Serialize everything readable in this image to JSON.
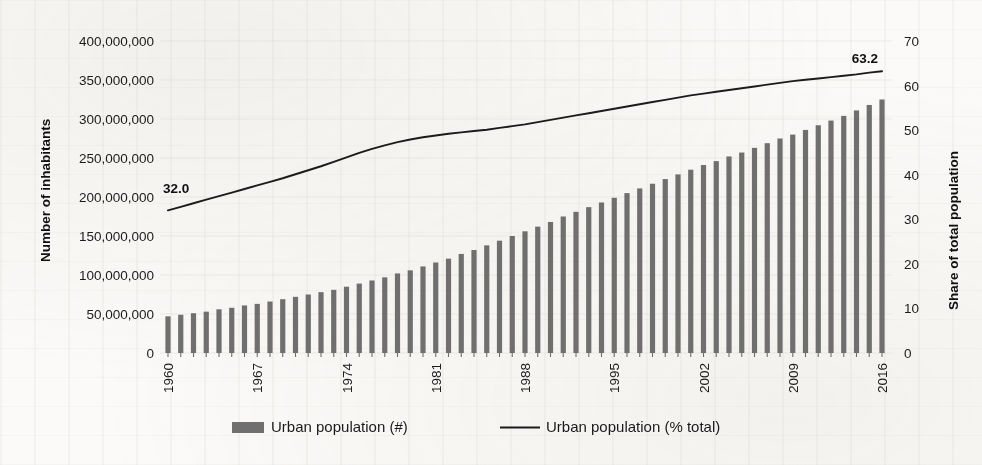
{
  "chart_data": {
    "type": "bar",
    "title": "",
    "subtitle": "",
    "xlabel": "",
    "ylabel": "Number of inhabitants",
    "y2label": "Share of total population",
    "grid": false,
    "legend_position": "bottom",
    "x": [
      1960,
      1961,
      1962,
      1963,
      1964,
      1965,
      1966,
      1967,
      1968,
      1969,
      1970,
      1971,
      1972,
      1973,
      1974,
      1975,
      1976,
      1977,
      1978,
      1979,
      1980,
      1981,
      1982,
      1983,
      1984,
      1985,
      1986,
      1987,
      1988,
      1989,
      1990,
      1991,
      1992,
      1993,
      1994,
      1995,
      1996,
      1997,
      1998,
      1999,
      2000,
      2001,
      2002,
      2003,
      2004,
      2005,
      2006,
      2007,
      2008,
      2009,
      2010,
      2011,
      2012,
      2013,
      2014,
      2015,
      2016
    ],
    "xtick_labels": [
      "1960",
      "1967",
      "1974",
      "1981",
      "1988",
      "1995",
      "2002",
      "2009",
      "2016"
    ],
    "ytick_labels": [
      "0",
      "50,000,000",
      "100,000,000",
      "150,000,000",
      "200,000,000",
      "250,000,000",
      "300,000,000",
      "350,000,000",
      "400,000,000"
    ],
    "y2tick_labels": [
      "0",
      "10",
      "20",
      "30",
      "40",
      "50",
      "60",
      "70"
    ],
    "ylim": [
      0,
      400000000
    ],
    "y2lim": [
      0,
      70
    ],
    "ytick_step": 50000000,
    "y2tick_step": 10,
    "series": [
      {
        "name": "Urban population (#)",
        "type": "bar",
        "axis": "left",
        "color": "#6f6f6f",
        "values": [
          47000000,
          49000000,
          51000000,
          53000000,
          56000000,
          58000000,
          61000000,
          63000000,
          66000000,
          69000000,
          72000000,
          75000000,
          78000000,
          81000000,
          85000000,
          89000000,
          93000000,
          97000000,
          102000000,
          106000000,
          111000000,
          116000000,
          121000000,
          127000000,
          132000000,
          138000000,
          144000000,
          150000000,
          156000000,
          162000000,
          168000000,
          175000000,
          181000000,
          187000000,
          193000000,
          199000000,
          205000000,
          211000000,
          217000000,
          223000000,
          229000000,
          235000000,
          241000000,
          246000000,
          252000000,
          257000000,
          263000000,
          269000000,
          275000000,
          280000000,
          286000000,
          292000000,
          298000000,
          304000000,
          311000000,
          318000000,
          325000000
        ]
      },
      {
        "name": "Urban population (% total)",
        "type": "line",
        "axis": "right",
        "color": "#1b1b1b",
        "values": [
          32.0,
          32.8,
          33.6,
          34.4,
          35.2,
          36.0,
          36.8,
          37.6,
          38.4,
          39.2,
          40.1,
          41.0,
          41.9,
          42.9,
          43.9,
          44.9,
          45.8,
          46.6,
          47.3,
          47.9,
          48.4,
          48.8,
          49.2,
          49.5,
          49.8,
          50.1,
          50.5,
          50.9,
          51.3,
          51.8,
          52.3,
          52.8,
          53.3,
          53.8,
          54.3,
          54.8,
          55.3,
          55.8,
          56.3,
          56.8,
          57.3,
          57.8,
          58.2,
          58.6,
          59.0,
          59.4,
          59.8,
          60.2,
          60.6,
          61.0,
          61.3,
          61.6,
          61.9,
          62.2,
          62.5,
          62.9,
          63.2
        ]
      }
    ],
    "annotations": [
      {
        "name": "start-value-label",
        "text": "32.0",
        "x": 1960,
        "value": 32.0
      },
      {
        "name": "end-value-label",
        "text": "63.2",
        "x": 2016,
        "value": 63.2
      }
    ]
  },
  "legend": {
    "items": [
      {
        "label": "Urban population (#)",
        "marker": "bar-swatch",
        "color": "#6f6f6f"
      },
      {
        "label": "Urban population (% total)",
        "marker": "line-swatch",
        "color": "#1b1b1b"
      }
    ]
  },
  "colors": {
    "bar": "#6f6f6f",
    "line": "#1b1b1b",
    "text": "#1b1b1b",
    "background": "#fbfaf8",
    "gridline": "#cfcac2"
  }
}
